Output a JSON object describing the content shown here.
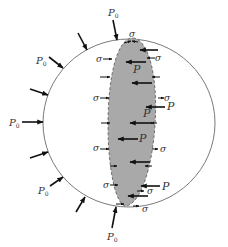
{
  "diagram": {
    "colors": {
      "outline": "#7a7a7a",
      "shaded_region": "#a9a9a9",
      "arrows": "#111111",
      "labels": "#333333"
    },
    "labels": {
      "external_pressure": "P",
      "external_pressure_sub": "0",
      "internal_pressure": "P",
      "stress": "σ"
    },
    "external_load_labels": [
      {
        "id": "p0-top",
        "text": "P",
        "sub": "0"
      },
      {
        "id": "p0-upper-left",
        "text": "P",
        "sub": "0"
      },
      {
        "id": "p0-left",
        "text": "P",
        "sub": "0"
      },
      {
        "id": "p0-lower-left",
        "text": "P",
        "sub": "0"
      },
      {
        "id": "p0-bottom",
        "text": "P",
        "sub": "0"
      }
    ],
    "internal_pressure_labels": [
      "P",
      "P",
      "P",
      "P",
      "P",
      "P"
    ],
    "stress_labels": [
      "σ",
      "σ",
      "σ",
      "σ",
      "σ",
      "σ",
      "σ",
      "σ",
      "σ",
      "σ",
      "σ"
    ]
  }
}
